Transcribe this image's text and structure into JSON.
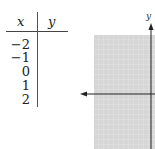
{
  "table": {
    "headers": {
      "x": "x",
      "y": "y"
    },
    "x_values": [
      "−2",
      "−1",
      "0",
      "1",
      "2"
    ],
    "y_values": [
      "",
      "",
      "",
      "",
      ""
    ]
  },
  "graph": {
    "y_axis_label": "y",
    "grid_color": "#d9d9d9",
    "grid_line_color": "#f2f2f2",
    "axis_color": "#222222"
  }
}
